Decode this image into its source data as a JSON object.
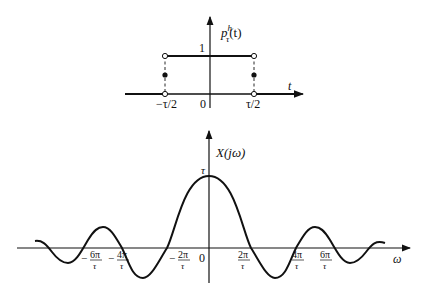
{
  "top_plot": {
    "y_label": "p",
    "y_label_sup": "h",
    "y_label_sub": "τ",
    "y_label_arg": "(t)",
    "x_label": "t",
    "level_label": "1",
    "ticks": {
      "left": "−τ/2",
      "origin": "0",
      "right": "τ/2"
    }
  },
  "bottom_plot": {
    "y_label": "X(jω)",
    "x_label": "ω",
    "peak_label": "τ",
    "origin_label": "0",
    "ticks": [
      {
        "sign": "−",
        "num": "6π",
        "den": "τ"
      },
      {
        "sign": "−",
        "num": "4π",
        "den": "τ"
      },
      {
        "sign": "−",
        "num": "2π",
        "den": "τ"
      },
      {
        "sign": "",
        "num": "2π",
        "den": "τ"
      },
      {
        "sign": "",
        "num": "4π",
        "den": "τ"
      },
      {
        "sign": "",
        "num": "6π",
        "den": "τ"
      }
    ]
  },
  "colors": {
    "stroke": "#111111",
    "background": "#ffffff"
  }
}
